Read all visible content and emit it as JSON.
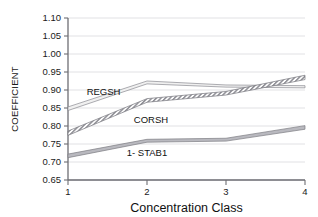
{
  "chart_data": {
    "type": "line",
    "title": "",
    "subtitle": "",
    "xlabel": "Concentration Class",
    "ylabel": "COEFFICIENT",
    "x": [
      1,
      2,
      3,
      4
    ],
    "xticklabels": [
      "1",
      "2",
      "3",
      "4"
    ],
    "xlim": [
      1,
      4
    ],
    "ylim": [
      0.65,
      1.1
    ],
    "yticks": [
      0.65,
      0.7,
      0.75,
      0.8,
      0.85,
      0.9,
      0.95,
      1.0,
      1.05,
      1.1
    ],
    "yticklabels": [
      "0.65",
      "0.70",
      "0.75",
      "0.80",
      "0.85",
      "0.90",
      "0.95",
      "1.00",
      "1.05",
      "1.10"
    ],
    "grid": "horizontal",
    "legend": "inline-annotations",
    "series": [
      {
        "name": "REGSH",
        "style": "solid-band",
        "fill": "#f0f0f0",
        "stroke": "#8a8a90",
        "values": [
          0.848,
          0.921,
          0.911,
          0.909
        ],
        "upper": [
          0.853,
          0.925,
          0.914,
          0.912
        ],
        "lower": [
          0.843,
          0.917,
          0.908,
          0.906
        ],
        "label_x": 1.45,
        "label_y": 0.895
      },
      {
        "name": "CORSH",
        "style": "hatched-band",
        "fill": "#e4e4e8",
        "stroke": "#76767c",
        "values": [
          0.78,
          0.871,
          0.891,
          0.935
        ],
        "upper": [
          0.786,
          0.876,
          0.896,
          0.941
        ],
        "lower": [
          0.774,
          0.866,
          0.886,
          0.929
        ],
        "label_x": 2.05,
        "label_y": 0.818
      },
      {
        "name": "1- STAB1",
        "style": "solid-band",
        "fill": "#b9b9bf",
        "stroke": "#7d7d83",
        "values": [
          0.717,
          0.759,
          0.762,
          0.796
        ],
        "upper": [
          0.722,
          0.763,
          0.766,
          0.801
        ],
        "lower": [
          0.712,
          0.755,
          0.758,
          0.791
        ],
        "label_x": 2.0,
        "label_y": 0.727
      }
    ],
    "annotations": [
      {
        "text": "REGSH",
        "x": 1.45,
        "y": 0.895
      },
      {
        "text": "CORSH",
        "x": 2.05,
        "y": 0.818
      },
      {
        "text": "1- STAB1",
        "x": 2.0,
        "y": 0.727
      }
    ]
  }
}
